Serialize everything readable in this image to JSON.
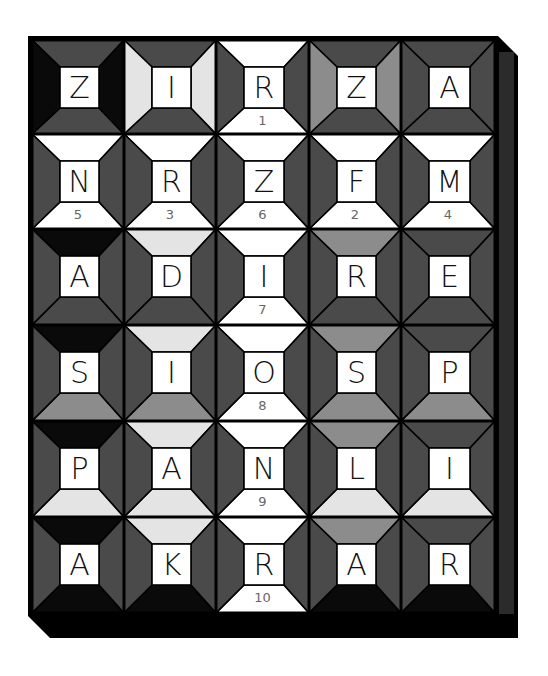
{
  "puzzle": {
    "type": "quilt-cipher-grid",
    "columns": 5,
    "rows": 6,
    "colors": {
      "black": "#0a0a0a",
      "dark": "#4a4a4a",
      "medium": "#8c8c8c",
      "light": "#e4e4e4",
      "white": "#ffffff",
      "outline": "#000000",
      "side_face": "#2b2b2b"
    },
    "cells": [
      [
        {
          "letter": "Z",
          "number": "",
          "top": "dark",
          "left": "black",
          "right": "black",
          "bottom": "dark"
        },
        {
          "letter": "I",
          "number": "",
          "top": "dark",
          "left": "light",
          "right": "light",
          "bottom": "dark"
        },
        {
          "letter": "R",
          "number": "1",
          "top": "white",
          "left": "dark",
          "right": "dark",
          "bottom": "white"
        },
        {
          "letter": "Z",
          "number": "",
          "top": "dark",
          "left": "medium",
          "right": "medium",
          "bottom": "dark"
        },
        {
          "letter": "A",
          "number": "",
          "top": "dark",
          "left": "dark",
          "right": "dark",
          "bottom": "dark"
        }
      ],
      [
        {
          "letter": "N",
          "number": "5",
          "top": "white",
          "left": "dark",
          "right": "dark",
          "bottom": "white"
        },
        {
          "letter": "R",
          "number": "3",
          "top": "white",
          "left": "dark",
          "right": "dark",
          "bottom": "white"
        },
        {
          "letter": "Z",
          "number": "6",
          "top": "white",
          "left": "dark",
          "right": "dark",
          "bottom": "white"
        },
        {
          "letter": "F",
          "number": "2",
          "top": "white",
          "left": "dark",
          "right": "dark",
          "bottom": "white"
        },
        {
          "letter": "M",
          "number": "4",
          "top": "white",
          "left": "dark",
          "right": "dark",
          "bottom": "white"
        }
      ],
      [
        {
          "letter": "A",
          "number": "",
          "top": "black",
          "left": "dark",
          "right": "dark",
          "bottom": "dark"
        },
        {
          "letter": "D",
          "number": "",
          "top": "light",
          "left": "dark",
          "right": "dark",
          "bottom": "dark"
        },
        {
          "letter": "I",
          "number": "7",
          "top": "white",
          "left": "dark",
          "right": "dark",
          "bottom": "white"
        },
        {
          "letter": "R",
          "number": "",
          "top": "medium",
          "left": "dark",
          "right": "dark",
          "bottom": "dark"
        },
        {
          "letter": "E",
          "number": "",
          "top": "dark",
          "left": "dark",
          "right": "dark",
          "bottom": "dark"
        }
      ],
      [
        {
          "letter": "S",
          "number": "",
          "top": "black",
          "left": "dark",
          "right": "dark",
          "bottom": "medium"
        },
        {
          "letter": "I",
          "number": "",
          "top": "light",
          "left": "dark",
          "right": "dark",
          "bottom": "medium"
        },
        {
          "letter": "O",
          "number": "8",
          "top": "white",
          "left": "dark",
          "right": "dark",
          "bottom": "white"
        },
        {
          "letter": "S",
          "number": "",
          "top": "medium",
          "left": "dark",
          "right": "dark",
          "bottom": "medium"
        },
        {
          "letter": "P",
          "number": "",
          "top": "dark",
          "left": "dark",
          "right": "dark",
          "bottom": "medium"
        }
      ],
      [
        {
          "letter": "P",
          "number": "",
          "top": "black",
          "left": "dark",
          "right": "dark",
          "bottom": "light"
        },
        {
          "letter": "A",
          "number": "",
          "top": "light",
          "left": "dark",
          "right": "dark",
          "bottom": "light"
        },
        {
          "letter": "N",
          "number": "9",
          "top": "white",
          "left": "dark",
          "right": "dark",
          "bottom": "white"
        },
        {
          "letter": "L",
          "number": "",
          "top": "medium",
          "left": "dark",
          "right": "dark",
          "bottom": "light"
        },
        {
          "letter": "I",
          "number": "",
          "top": "dark",
          "left": "dark",
          "right": "dark",
          "bottom": "light"
        }
      ],
      [
        {
          "letter": "A",
          "number": "",
          "top": "black",
          "left": "dark",
          "right": "dark",
          "bottom": "black"
        },
        {
          "letter": "K",
          "number": "",
          "top": "light",
          "left": "dark",
          "right": "dark",
          "bottom": "black"
        },
        {
          "letter": "R",
          "number": "10",
          "top": "white",
          "left": "dark",
          "right": "dark",
          "bottom": "white"
        },
        {
          "letter": "A",
          "number": "",
          "top": "medium",
          "left": "dark",
          "right": "dark",
          "bottom": "black"
        },
        {
          "letter": "R",
          "number": "",
          "top": "dark",
          "left": "dark",
          "right": "dark",
          "bottom": "black"
        }
      ]
    ]
  }
}
